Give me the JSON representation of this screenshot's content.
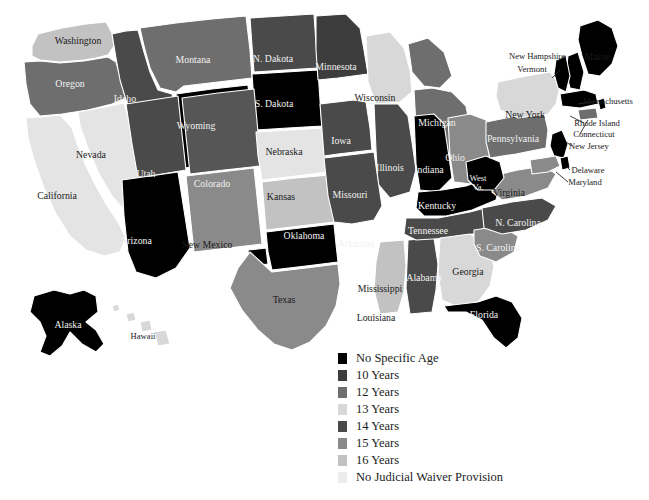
{
  "figure": {
    "type": "choropleth-map",
    "region": "United States",
    "background": "#ffffff"
  },
  "legend": {
    "title": "",
    "position": "bottom-center",
    "items": [
      {
        "label": "No Specific Age",
        "color": "#000000"
      },
      {
        "label": "10 Years",
        "color": "#3d3d3d"
      },
      {
        "label": "12 Years",
        "color": "#6e6e6e"
      },
      {
        "label": "13 Years",
        "color": "#d8d8d8"
      },
      {
        "label": "14 Years",
        "color": "#4a4a4a"
      },
      {
        "label": "15 Years",
        "color": "#8a8a8a"
      },
      {
        "label": "16 Years",
        "color": "#c2c2c2"
      },
      {
        "label": "No Judicial Waiver Provision",
        "color": "#ececec"
      }
    ]
  },
  "chart_data": {
    "type": "heatmap",
    "title": "",
    "xlabel": "",
    "ylabel": "",
    "categories": [
      "No Specific Age",
      "10 Years",
      "12 Years",
      "13 Years",
      "14 Years",
      "15 Years",
      "16 Years",
      "No Judicial Waiver Provision"
    ],
    "values": [
      17,
      3,
      4,
      4,
      12,
      4,
      4,
      3
    ],
    "series": [
      {
        "name": "Minimum age for judicial waiver to adult court",
        "values": [
          17,
          3,
          4,
          4,
          12,
          4,
          4,
          3
        ]
      }
    ],
    "states": [
      {
        "name": "Washington",
        "abbr": "WA",
        "label": "Washington",
        "category": "16 Years",
        "color": "#c2c2c2",
        "lx": 78,
        "ly": 41,
        "tone": "dark"
      },
      {
        "name": "Oregon",
        "abbr": "OR",
        "label": "Oregon",
        "category": "12 Years",
        "color": "#6e6e6e",
        "lx": 70,
        "ly": 84,
        "tone": "light"
      },
      {
        "name": "Idaho",
        "abbr": "ID",
        "label": "Idaho",
        "category": "14 Years",
        "color": "#4a4a4a",
        "lx": 125,
        "ly": 99,
        "tone": "light"
      },
      {
        "name": "Montana",
        "abbr": "MT",
        "label": "Montana",
        "category": "12 Years",
        "color": "#6e6e6e",
        "lx": 193,
        "ly": 60,
        "tone": "light"
      },
      {
        "name": "Wyoming",
        "abbr": "WY",
        "label": "Wyoming",
        "category": "No Specific Age",
        "color": "#000000",
        "lx": 196,
        "ly": 126,
        "tone": "light"
      },
      {
        "name": "N. Dakota",
        "abbr": "ND",
        "label": "N. Dakota",
        "category": "14 Years",
        "color": "#4a4a4a",
        "lx": 273,
        "ly": 59,
        "tone": "light"
      },
      {
        "name": "S. Dakota",
        "abbr": "SD",
        "label": "S. Dakota",
        "category": "No Specific Age",
        "color": "#000000",
        "lx": 274,
        "ly": 104,
        "tone": "light"
      },
      {
        "name": "Minnesota",
        "abbr": "MN",
        "label": "Minnesota",
        "category": "14 Years",
        "color": "#3d3d3d",
        "lx": 336,
        "ly": 67,
        "tone": "light"
      },
      {
        "name": "Wisconsin",
        "abbr": "WI",
        "label": "Wisconsin",
        "category": "No Judicial Waiver Provision",
        "color": "#d8d8d8",
        "lx": 375,
        "ly": 98,
        "tone": "dark"
      },
      {
        "name": "Michigan",
        "abbr": "MI",
        "label": "Michigan",
        "category": "14 Years",
        "color": "#6e6e6e",
        "lx": 437,
        "ly": 123,
        "tone": "light"
      },
      {
        "name": "Nevada",
        "abbr": "NV",
        "label": "Nevada",
        "category": "No Judicial Waiver Provision",
        "color": "#e4e4e4",
        "lx": 91,
        "ly": 155,
        "tone": "dark"
      },
      {
        "name": "Utah",
        "abbr": "UT",
        "label": "Utah",
        "category": "14 Years",
        "color": "#4a4a4a",
        "lx": 146,
        "ly": 174,
        "tone": "light"
      },
      {
        "name": "Colorado",
        "abbr": "CO",
        "label": "Colorado",
        "category": "12 Years",
        "color": "#565656",
        "lx": 212,
        "ly": 184,
        "tone": "light"
      },
      {
        "name": "Nebraska",
        "abbr": "NE",
        "label": "Nebraska",
        "category": "No Judicial Waiver Provision",
        "color": "#e4e4e4",
        "lx": 284,
        "ly": 152,
        "tone": "dark"
      },
      {
        "name": "Iowa",
        "abbr": "IA",
        "label": "Iowa",
        "category": "14 Years",
        "color": "#4a4a4a",
        "lx": 341,
        "ly": 141,
        "tone": "light"
      },
      {
        "name": "Illinois",
        "abbr": "IL",
        "label": "Illinois",
        "category": "13 Years",
        "color": "#4a4a4a",
        "lx": 390,
        "ly": 168,
        "tone": "light"
      },
      {
        "name": "Kansas",
        "abbr": "KS",
        "label": "Kansas",
        "category": "10 Years",
        "color": "#c2c2c2",
        "lx": 281,
        "ly": 197,
        "tone": "dark"
      },
      {
        "name": "Missouri",
        "abbr": "MO",
        "label": "Missouri",
        "category": "12 Years",
        "color": "#4a4a4a",
        "lx": 350,
        "ly": 195,
        "tone": "light"
      },
      {
        "name": "Indiana",
        "abbr": "IN",
        "label": "Indiana",
        "category": "No Specific Age",
        "color": "#000000",
        "lx": 429,
        "ly": 170,
        "tone": "light"
      },
      {
        "name": "Ohio",
        "abbr": "OH",
        "label": "Ohio",
        "category": "14 Years",
        "color": "#8a8a8a",
        "lx": 455,
        "ly": 158,
        "tone": "light"
      },
      {
        "name": "California",
        "abbr": "CA",
        "label": "California",
        "category": "16 Years",
        "color": "#e4e4e4",
        "lx": 57,
        "ly": 196,
        "tone": "dark"
      },
      {
        "name": "Arizona",
        "abbr": "AZ",
        "label": "Arizona",
        "category": "No Specific Age",
        "color": "#000000",
        "lx": 136,
        "ly": 241,
        "tone": "light"
      },
      {
        "name": "New Mexico",
        "abbr": "NM",
        "label": "New Mexico",
        "category": "15 Years",
        "color": "#8a8a8a",
        "lx": 207,
        "ly": 245,
        "tone": "dark"
      },
      {
        "name": "Oklahoma",
        "abbr": "OK",
        "label": "Oklahoma",
        "category": "No Specific Age",
        "color": "#000000",
        "lx": 304,
        "ly": 236,
        "tone": "light"
      },
      {
        "name": "Arkansas",
        "abbr": "AR",
        "label": "Arkansas",
        "category": "No Specific Age",
        "color": "#000000",
        "lx": 356,
        "ly": 244,
        "tone": "light"
      },
      {
        "name": "Texas",
        "abbr": "TX",
        "label": "Texas",
        "category": "15 Years",
        "color": "#8a8a8a",
        "lx": 284,
        "ly": 300,
        "tone": "dark"
      },
      {
        "name": "Louisiana",
        "abbr": "LA",
        "label": "Louisiana",
        "category": "No Judicial Waiver Provision",
        "color": "#c2c2c2",
        "lx": 376,
        "ly": 318,
        "tone": "dark"
      },
      {
        "name": "Mississippi",
        "abbr": "MS",
        "label": "Mississippi",
        "category": "13 Years",
        "color": "#c2c2c2",
        "lx": 380,
        "ly": 289,
        "tone": "dark"
      },
      {
        "name": "Alabama",
        "abbr": "AL",
        "label": "Alabama",
        "category": "14 Years",
        "color": "#4a4a4a",
        "lx": 424,
        "ly": 278,
        "tone": "light"
      },
      {
        "name": "Tennessee",
        "abbr": "TN",
        "label": "Tennessee",
        "category": "14 Years",
        "color": "#4a4a4a",
        "lx": 428,
        "ly": 231,
        "tone": "light"
      },
      {
        "name": "Kentucky",
        "abbr": "KY",
        "label": "Kentucky",
        "category": "No Specific Age",
        "color": "#000000",
        "lx": 437,
        "ly": 206,
        "tone": "light"
      },
      {
        "name": "Georgia",
        "abbr": "GA",
        "label": "Georgia",
        "category": "13 Years",
        "color": "#d8d8d8",
        "lx": 468,
        "ly": 272,
        "tone": "dark"
      },
      {
        "name": "Florida",
        "abbr": "FL",
        "label": "Florida",
        "category": "No Specific Age",
        "color": "#000000",
        "lx": 484,
        "ly": 315,
        "tone": "light"
      },
      {
        "name": "S. Carolina",
        "abbr": "SC",
        "label": "S. Carolina",
        "category": "14 Years",
        "color": "#8a8a8a",
        "lx": 498,
        "ly": 248,
        "tone": "light"
      },
      {
        "name": "N. Carolina",
        "abbr": "NC",
        "label": "N. Carolina",
        "category": "14 Years",
        "color": "#4a4a4a",
        "lx": 518,
        "ly": 223,
        "tone": "light"
      },
      {
        "name": "Virginia",
        "abbr": "VA",
        "label": "Virginia",
        "category": "14 Years",
        "color": "#8a8a8a",
        "lx": 509,
        "ly": 193,
        "tone": "dark"
      },
      {
        "name": "West Va.",
        "abbr": "WV",
        "label": "West\nVa.",
        "category": "No Specific Age",
        "color": "#000000",
        "lx": 478,
        "ly": 183,
        "tone": "light"
      },
      {
        "name": "Pennsylvania",
        "abbr": "PA",
        "label": "Pennsylvania",
        "category": "14 Years",
        "color": "#6e6e6e",
        "lx": 513,
        "ly": 139,
        "tone": "light"
      },
      {
        "name": "New York",
        "abbr": "NY",
        "label": "New York",
        "category": "13 Years",
        "color": "#d8d8d8",
        "lx": 525,
        "ly": 115,
        "tone": "dark"
      },
      {
        "name": "Maine",
        "abbr": "ME",
        "label": "Maine",
        "category": "No Specific Age",
        "color": "#000000",
        "lx": 597,
        "ly": 57,
        "tone": "dark"
      },
      {
        "name": "New Hampshire",
        "abbr": "NH",
        "label": "New Hampshire",
        "category": "No Specific Age",
        "color": "#000000",
        "lx": 537,
        "ly": 56,
        "tone": "dark"
      },
      {
        "name": "Vermont",
        "abbr": "VT",
        "label": "Vermont",
        "category": "No Specific Age",
        "color": "#000000",
        "lx": 532,
        "ly": 69,
        "tone": "dark"
      },
      {
        "name": "Massachusetts",
        "abbr": "MA",
        "label": "Massachusetts",
        "category": "No Specific Age",
        "color": "#000000",
        "lx": 608,
        "ly": 101,
        "tone": "dark"
      },
      {
        "name": "Rhode Island",
        "abbr": "RI",
        "label": "Rhode Island",
        "category": "No Specific Age",
        "color": "#000000",
        "lx": 597,
        "ly": 123,
        "tone": "dark"
      },
      {
        "name": "Connecticut",
        "abbr": "CT",
        "label": "Connecticut",
        "category": "14 Years",
        "color": "#6e6e6e",
        "lx": 594,
        "ly": 134,
        "tone": "dark"
      },
      {
        "name": "New Jersey",
        "abbr": "NJ",
        "label": "New Jersey",
        "category": "No Specific Age",
        "color": "#000000",
        "lx": 589,
        "ly": 146,
        "tone": "dark"
      },
      {
        "name": "Delaware",
        "abbr": "DE",
        "label": "Delaware",
        "category": "No Specific Age",
        "color": "#000000",
        "lx": 588,
        "ly": 170,
        "tone": "dark"
      },
      {
        "name": "Maryland",
        "abbr": "MD",
        "label": "Maryland",
        "category": "15 Years",
        "color": "#8a8a8a",
        "lx": 585,
        "ly": 182,
        "tone": "dark"
      },
      {
        "name": "Alaska",
        "abbr": "AK",
        "label": "Alaska",
        "category": "No Specific Age",
        "color": "#000000",
        "lx": 68,
        "ly": 325,
        "tone": "light"
      },
      {
        "name": "Hawaii",
        "abbr": "HI",
        "label": "Hawaii",
        "category": "No Judicial Waiver Provision",
        "color": "#d8d8d8",
        "lx": 143,
        "ly": 336,
        "tone": "dark"
      }
    ]
  }
}
